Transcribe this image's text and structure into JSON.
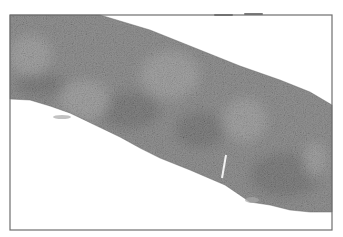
{
  "image": {
    "kind": "grayscale histology micrograph",
    "subject": "band of tissue section crossing the field diagonally",
    "width": 343,
    "height": 237
  },
  "frame": {
    "x": 10,
    "y": 15,
    "width": 322,
    "height": 215,
    "stroke": "#6e6e6e"
  },
  "tissue": {
    "base_color": "#8a8a8a",
    "dark_color": "#5a5a5a",
    "light_color": "#b4b4b4",
    "upper_edge": [
      [
        10,
        15
      ],
      [
        100,
        15
      ],
      [
        150,
        30
      ],
      [
        200,
        50
      ],
      [
        240,
        66
      ],
      [
        280,
        80
      ],
      [
        310,
        92
      ],
      [
        332,
        105
      ]
    ],
    "lower_edge": [
      [
        332,
        212
      ],
      [
        310,
        212
      ],
      [
        290,
        210
      ],
      [
        270,
        205
      ],
      [
        250,
        202
      ],
      [
        225,
        185
      ],
      [
        190,
        170
      ],
      [
        160,
        158
      ],
      [
        140,
        148
      ],
      [
        120,
        137
      ],
      [
        95,
        125
      ],
      [
        70,
        113
      ],
      [
        50,
        106
      ],
      [
        30,
        100
      ],
      [
        10,
        99
      ]
    ],
    "pale_patches": [
      {
        "cx": 30,
        "cy": 55,
        "rx": 22,
        "ry": 20
      },
      {
        "cx": 85,
        "cy": 100,
        "rx": 25,
        "ry": 20
      },
      {
        "cx": 170,
        "cy": 75,
        "rx": 30,
        "ry": 24
      },
      {
        "cx": 245,
        "cy": 120,
        "rx": 22,
        "ry": 22
      },
      {
        "cx": 315,
        "cy": 160,
        "rx": 12,
        "ry": 18
      }
    ],
    "dark_patches": [
      {
        "cx": 40,
        "cy": 85,
        "rx": 25,
        "ry": 12
      },
      {
        "cx": 130,
        "cy": 110,
        "rx": 30,
        "ry": 18
      },
      {
        "cx": 200,
        "cy": 130,
        "rx": 25,
        "ry": 18
      },
      {
        "cx": 285,
        "cy": 175,
        "rx": 35,
        "ry": 22
      }
    ],
    "artifacts": [
      {
        "type": "white-crack",
        "x1": 226,
        "y1": 155,
        "x2": 222,
        "y2": 178
      },
      {
        "type": "detached-fragment",
        "cx": 252,
        "cy": 200,
        "rx": 7,
        "ry": 3
      },
      {
        "type": "detached-fragment",
        "cx": 62,
        "cy": 117,
        "rx": 9,
        "ry": 2
      }
    ]
  },
  "top_marks": [
    {
      "x1": 215,
      "x2": 232,
      "y": 15
    },
    {
      "x1": 245,
      "x2": 262,
      "y": 14
    }
  ]
}
